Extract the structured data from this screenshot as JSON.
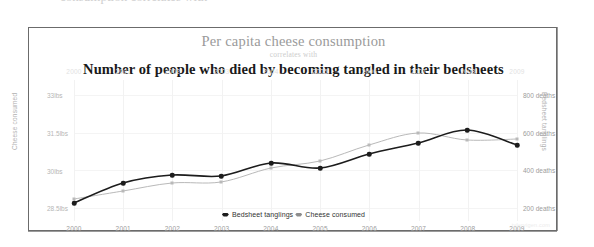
{
  "page": {
    "cut_off_text_top": "consumption correlates with"
  },
  "chart_panel": {
    "title_primary": "Per capita cheese consumption",
    "title_connector": "correlates with",
    "title_secondary": "Number of people who died by becoming tangled in their bedsheets",
    "watermark": "tylervigen.com",
    "legend": {
      "items": [
        {
          "label": "Bedsheet tanglings",
          "marker": "diamond-marker-dark",
          "color": "#1c1c1c"
        },
        {
          "label": "Cheese consumed",
          "marker": "diamond-marker-light",
          "color": "#8d8d8d"
        }
      ]
    }
  },
  "chart_data": {
    "type": "line",
    "title": "Per capita cheese consumption correlates with Number of people who died by becoming tangled in their bedsheets",
    "subtitle": "correlates with",
    "xlabel": "",
    "grid": true,
    "legend_position": "bottom-center",
    "x": [
      2000,
      2001,
      2002,
      2003,
      2004,
      2005,
      2006,
      2007,
      2008,
      2009
    ],
    "x_axis_top_ticks": [
      "2000",
      "2001",
      "2002",
      "2003",
      "2004",
      "2005",
      "2006",
      "2007",
      "2008",
      "2009"
    ],
    "x_axis_bottom_ticks": [
      "2000",
      "2001",
      "2002",
      "2003",
      "2004",
      "2005",
      "2006",
      "2007",
      "2008",
      "2009"
    ],
    "axes": [
      {
        "id": "left",
        "label": "Cheese consumed",
        "ticks": [
          "33lbs",
          "31.5lbs",
          "30lbs",
          "28.5lbs"
        ],
        "tick_values": [
          33,
          31.5,
          30,
          28.5
        ],
        "ylim": [
          28.0,
          33.6
        ]
      },
      {
        "id": "right",
        "label": "Bedsheet tanglings",
        "ticks": [
          "800 deaths",
          "600 deaths",
          "400 deaths",
          "200 deaths"
        ],
        "tick_values": [
          800,
          600,
          400,
          200
        ],
        "ylim": [
          130,
          880
        ]
      }
    ],
    "series": [
      {
        "name": "Bedsheet tanglings",
        "axis": "right",
        "color": "#1c1c1c",
        "marker": "circle",
        "unit": "deaths",
        "values": [
          327,
          456,
          509,
          497,
          596,
          573,
          661,
          741,
          809,
          717
        ],
        "pixel_points": [
          [
            0,
            123
          ],
          [
            49,
            103
          ],
          [
            98,
            95
          ],
          [
            147,
            96
          ],
          [
            197,
            83
          ],
          [
            246,
            88
          ],
          [
            295,
            74
          ],
          [
            344,
            63
          ],
          [
            393,
            50
          ],
          [
            443,
            65
          ]
        ]
      },
      {
        "name": "Cheese consumed",
        "axis": "left",
        "color": "#b9b9b9",
        "marker": "square",
        "unit": "lbs",
        "values": [
          29.8,
          30.1,
          30.5,
          30.6,
          31.3,
          31.7,
          32.6,
          33.1,
          32.7,
          32.8
        ],
        "pixel_points": [
          [
            0,
            119
          ],
          [
            49,
            111
          ],
          [
            98,
            103
          ],
          [
            147,
            102
          ],
          [
            197,
            88
          ],
          [
            246,
            81
          ],
          [
            295,
            65
          ],
          [
            344,
            53
          ],
          [
            393,
            60
          ],
          [
            443,
            59
          ]
        ]
      }
    ]
  }
}
